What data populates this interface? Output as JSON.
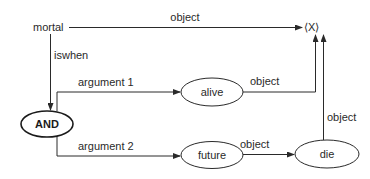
{
  "diagram": {
    "nodes": {
      "mortal": {
        "label": "mortal",
        "shape": "text"
      },
      "x": {
        "label": "⟨X⟩",
        "shape": "text"
      },
      "and": {
        "label": "AND",
        "shape": "ellipse",
        "bold": true
      },
      "alive": {
        "label": "alive",
        "shape": "ellipse"
      },
      "future": {
        "label": "future",
        "shape": "ellipse"
      },
      "die": {
        "label": "die",
        "shape": "ellipse"
      }
    },
    "edges": {
      "mortal_x": {
        "from": "mortal",
        "to": "x",
        "label": "object"
      },
      "mortal_and": {
        "from": "mortal",
        "to": "and",
        "label": "iswhen"
      },
      "and_alive": {
        "from": "and",
        "to": "alive",
        "label": "argument 1"
      },
      "and_future": {
        "from": "and",
        "to": "future",
        "label": "argument 2"
      },
      "alive_x": {
        "from": "alive",
        "to": "x",
        "label": "object"
      },
      "future_die": {
        "from": "future",
        "to": "die",
        "label": "object"
      },
      "die_x": {
        "from": "die",
        "to": "x",
        "label": "object"
      }
    },
    "colors": {
      "line": "#2a2a2a",
      "background": "#ffffff"
    }
  }
}
